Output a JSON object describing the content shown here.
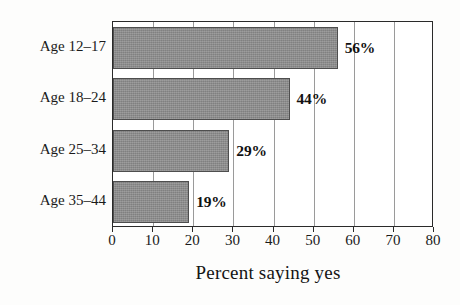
{
  "chart_data": {
    "type": "bar",
    "orientation": "horizontal",
    "title": "",
    "subtitle": "",
    "xlabel": "Percent saying yes",
    "ylabel": "",
    "categories": [
      "Age 12–17",
      "Age 18–24",
      "Age 25–34",
      "Age 35–44"
    ],
    "values": [
      56,
      44,
      29,
      19
    ],
    "value_labels": [
      "56%",
      "44%",
      "29%",
      "19%"
    ],
    "xlim": [
      0,
      80
    ],
    "xticks": [
      0,
      10,
      20,
      30,
      40,
      50,
      60,
      70,
      80
    ],
    "xtick_labels": [
      "0",
      "10",
      "20",
      "30",
      "40",
      "50",
      "60",
      "70",
      "80"
    ],
    "grid": true,
    "grid_axis": "x",
    "legend": false,
    "legend_position": "none",
    "bar_color": "#8a8a8a",
    "bar_edge_color": "#4e4e4e",
    "axis_color": "#2a2a2a",
    "grid_color": "#9a9a9a",
    "label_color": "#111111",
    "background_color": "#fdfdfc",
    "plot_background_color": "#ffffff"
  }
}
